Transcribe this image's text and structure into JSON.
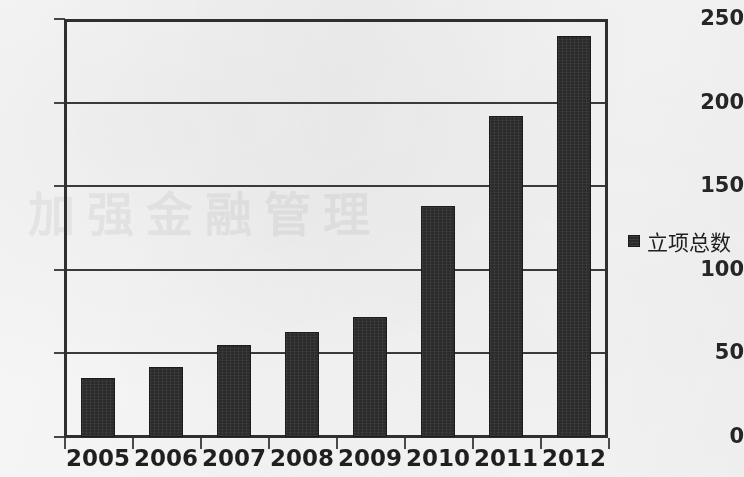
{
  "chart_data": {
    "type": "bar",
    "title": "",
    "xlabel": "",
    "ylabel": "",
    "categories": [
      "2005",
      "2006",
      "2007",
      "2008",
      "2009",
      "2010",
      "2011",
      "2012"
    ],
    "values": [
      35,
      42,
      55,
      63,
      72,
      138,
      192,
      240
    ],
    "series": [
      {
        "name": "立项总数",
        "values": [
          35,
          42,
          55,
          63,
          72,
          138,
          192,
          240
        ]
      }
    ],
    "ylim": [
      0,
      250
    ],
    "yticks": [
      0,
      50,
      100,
      150,
      200,
      250
    ],
    "ytick_labels": [
      "0",
      "50",
      "100",
      "150",
      "200",
      "250"
    ],
    "grid": true,
    "grid_axis": "y",
    "legend_position": "right",
    "bar_color": "#2b2b2b",
    "frame_color": "#2f2f2f",
    "background_color": "#f6f5f3"
  },
  "legend": {
    "entries": [
      {
        "label": "立项总数",
        "color": "#2b2b2b",
        "marker": "square-marker"
      }
    ]
  },
  "watermark": {
    "text": "加强金融管理"
  }
}
